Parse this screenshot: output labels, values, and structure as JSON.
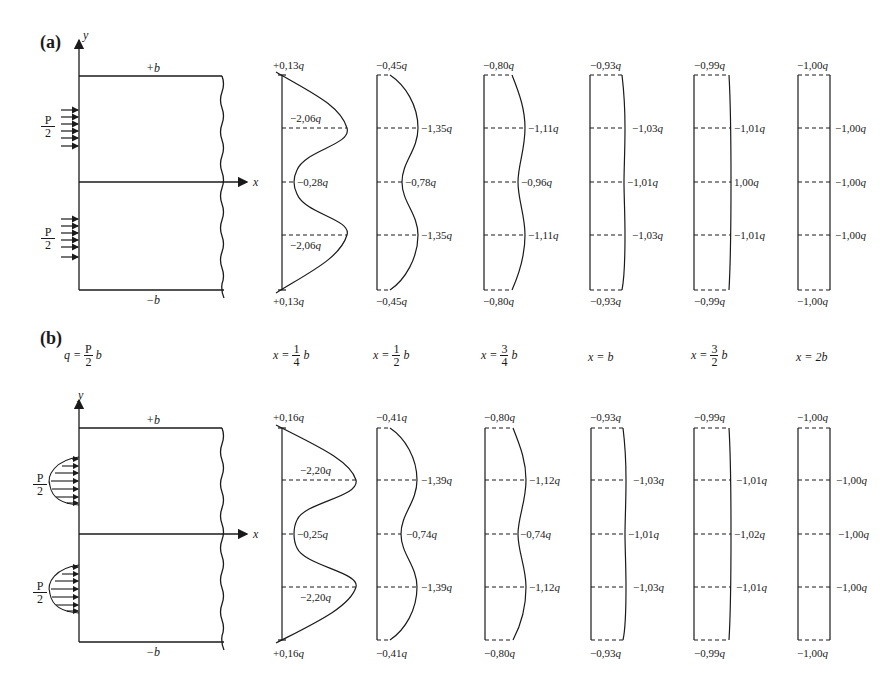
{
  "panels": [
    {
      "tag": "(a)",
      "load_type": "uniform",
      "plate": {
        "top_label": "+b",
        "bottom_label": "−b",
        "x_axis": "x",
        "y_axis": "y",
        "load_num": "P",
        "load_den": "2"
      },
      "columns": [
        {
          "x_pos": "x = 1/4 b",
          "top": "+0,13q",
          "upper": "−2,06q",
          "mid": "−0,28q",
          "lower": "−2,06q",
          "bottom": "+0,13q"
        },
        {
          "x_pos": "x = 1/2 b",
          "top": "−0,45q",
          "upper": "−1,35q",
          "mid": "−0,78q",
          "lower": "−1,35q",
          "bottom": "−0,45q"
        },
        {
          "x_pos": "x = 3/4 b",
          "top": "−0,80q",
          "upper": "−1,11q",
          "mid": "−0,96q",
          "lower": "−1,11q",
          "bottom": "−0,80q"
        },
        {
          "x_pos": "x = b",
          "top": "−0,93q",
          "upper": "−1,03q",
          "mid": "−1,01q",
          "lower": "−1,03q",
          "bottom": "−0,93q"
        },
        {
          "x_pos": "x = 3/2 b",
          "top": "−0,99q",
          "upper": "−1,01q",
          "mid": "1,00q",
          "lower": "−1,01q",
          "bottom": "−0,99q"
        },
        {
          "x_pos": "x = 2b",
          "top": "−1,00q",
          "upper": "−1,00q",
          "mid": "−1,00q",
          "lower": "−1,00q",
          "bottom": "−1,00q"
        }
      ]
    },
    {
      "tag": "(b)",
      "load_type": "parabolic",
      "q_def": {
        "lhs": "q =",
        "num": "P",
        "den": "2",
        "rhs": "b"
      },
      "plate": {
        "top_label": "+b",
        "bottom_label": "−b",
        "x_axis": "x",
        "y_axis": "y",
        "load_num": "P",
        "load_den": "2"
      },
      "columns": [
        {
          "top": "+0,16q",
          "upper": "−2,20q",
          "mid": "−0,25q",
          "lower": "−2,20q",
          "bottom": "+0,16q"
        },
        {
          "top": "−0,41q",
          "upper": "−1,39q",
          "mid": "−0,74q",
          "lower": "−1,39q",
          "bottom": "−0,41q"
        },
        {
          "top": "−0,80q",
          "upper": "−1,12q",
          "mid": "−0,74q",
          "lower": "−1,12q",
          "bottom": "−0,80q"
        },
        {
          "top": "−0,93q",
          "upper": "−1,03q",
          "mid": "−1,01q",
          "lower": "−1,03q",
          "bottom": "−0,93q"
        },
        {
          "top": "−0,99q",
          "upper": "−1,01q",
          "mid": "−1,02q",
          "lower": "−1,01q",
          "bottom": "−0,99q"
        },
        {
          "top": "−1,00q",
          "upper": "−1,00q",
          "mid": "−1,00q",
          "lower": "−1,00q",
          "bottom": "−1,00q"
        }
      ]
    }
  ],
  "x_positions": [
    {
      "pre": "x =",
      "num": "1",
      "den": "4",
      "post": "b"
    },
    {
      "pre": "x =",
      "num": "1",
      "den": "2",
      "post": "b"
    },
    {
      "pre": "x =",
      "num": "3",
      "den": "4",
      "post": "b"
    },
    {
      "pre": "x = b",
      "num": "",
      "den": "",
      "post": ""
    },
    {
      "pre": "x =",
      "num": "3",
      "den": "2",
      "post": "b"
    },
    {
      "pre": "x = 2b",
      "num": "",
      "den": "",
      "post": ""
    }
  ]
}
